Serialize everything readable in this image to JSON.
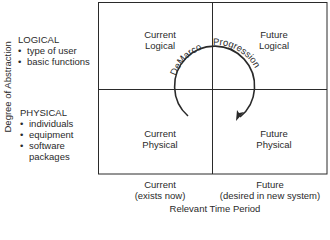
{
  "y_axis_label": "Degree of Abstraction",
  "x_axis_label": "Relevant Time Period",
  "left_groups": [
    {
      "heading": "LOGICAL",
      "items": [
        "type of user",
        "basic functions"
      ]
    },
    {
      "heading": "PHYSICAL",
      "items": [
        "individuals",
        "equipment",
        "software",
        "packages"
      ]
    }
  ],
  "quadrants": {
    "top_left": [
      "Current",
      "Logical"
    ],
    "top_right": [
      "Future",
      "Logical"
    ],
    "bottom_left": [
      "Current",
      "Physical"
    ],
    "bottom_right": [
      "Future",
      "Physical"
    ]
  },
  "columns": [
    {
      "line1": "Current",
      "line2": "(exists now)"
    },
    {
      "line1": "Future",
      "line2": "(desired in new system)"
    }
  ],
  "arc_label": {
    "left": "DeMarco",
    "right": "Progression"
  },
  "colors": {
    "line": "#2a2a2a",
    "background": "#ffffff"
  }
}
